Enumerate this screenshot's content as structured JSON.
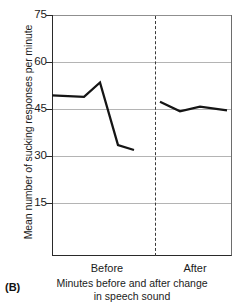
{
  "panel": {
    "label": "(B)"
  },
  "chart_data": {
    "type": "line",
    "title": "",
    "xlabel": "Minutes before and after change in speech sound",
    "xlabel_line1": "Minutes before and after change",
    "xlabel_line2": "in speech sound",
    "ylabel": "Mean number of sucking responses per minute",
    "ylim": [
      0,
      75
    ],
    "yticks": [
      15,
      30,
      45,
      60,
      75
    ],
    "ytick_labels": [
      "15",
      "30",
      "45",
      "60",
      "75"
    ],
    "grid": true,
    "grid_axis": "y",
    "legend": "none",
    "categories": [
      "Before",
      "After"
    ],
    "phase_divider": {
      "label": "change in speech sound",
      "style": "dashed",
      "x_fraction": 0.572
    },
    "series": [
      {
        "name": "Before",
        "x": [
          0,
          1,
          2,
          3,
          4
        ],
        "values": [
          50,
          49.5,
          54,
          34.5,
          33
        ],
        "color": "#151515"
      },
      {
        "name": "After",
        "x": [
          5,
          6,
          7,
          8
        ],
        "values": [
          48,
          45,
          46.5,
          45.3
        ],
        "color": "#151515"
      }
    ]
  },
  "axis": {
    "y_title": "Mean number of sucking responses per minute",
    "tick_75": "75",
    "tick_60": "60",
    "tick_45": "45",
    "tick_30": "30",
    "tick_15": "15",
    "cat_before": "Before",
    "cat_after": "After",
    "x_title_line1": "Minutes before and after change",
    "x_title_line2": "in speech sound"
  }
}
